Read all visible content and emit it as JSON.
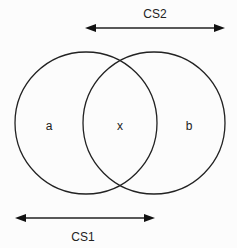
{
  "diagram": {
    "type": "venn",
    "sets": [
      {
        "id": "left",
        "region_label": "a"
      },
      {
        "id": "right",
        "region_label": "b"
      }
    ],
    "intersection_label": "x",
    "arrows": [
      {
        "id": "cs2",
        "label": "CS2",
        "spans": "right circle",
        "direction": "double-headed"
      },
      {
        "id": "cs1",
        "label": "CS1",
        "spans": "left circle",
        "direction": "double-headed"
      }
    ],
    "colors": {
      "stroke": "#222222",
      "background": "#fcfcfc"
    }
  }
}
